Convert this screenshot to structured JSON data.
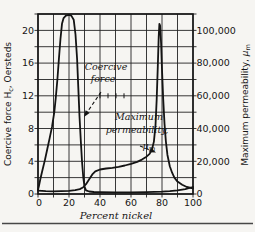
{
  "figure": {
    "paper_color": "#f6f5f2",
    "ink_color": "#141414"
  },
  "chart_data": {
    "type": "line",
    "xlabel": "Percent nickel",
    "ylabel_left": "Coercive force Hc, Oersteds",
    "ylabel_left_parts": {
      "pre": "Coercive force H",
      "sub": "c",
      "post": ", Oersteds"
    },
    "ylabel_right": "Maximum permeability, μm",
    "ylabel_right_parts": {
      "pre": "Maximum permeability, ",
      "mu": "μ",
      "sub": "m"
    },
    "xlim": [
      0,
      100
    ],
    "ylim_left": [
      0,
      22
    ],
    "ylim_right": [
      0,
      110000
    ],
    "grid": {
      "on": true,
      "x_step": 10,
      "y_left_step": 2,
      "y_right_step": 10000
    },
    "x_ticks": [
      "0",
      "20",
      "40",
      "60",
      "80",
      "100"
    ],
    "y_left_ticks": [
      "0",
      "4",
      "8",
      "12",
      "16",
      "20"
    ],
    "y_right_ticks": [
      "0",
      "20,000",
      "40,000",
      "60,000",
      "80,000",
      "100,000"
    ],
    "series": [
      {
        "name": "Coercive force",
        "axis": "left",
        "units": "Oersteds",
        "points": [
          [
            0,
            0.5
          ],
          [
            0.5,
            0.9
          ],
          [
            1.5,
            1.8
          ],
          [
            3,
            3
          ],
          [
            4.5,
            4.2
          ],
          [
            6,
            5.5
          ],
          [
            7.5,
            6.8
          ],
          [
            9,
            8.2
          ],
          [
            10.5,
            10
          ],
          [
            11.5,
            11.8
          ],
          [
            12.5,
            14
          ],
          [
            13.5,
            16.5
          ],
          [
            14.5,
            19
          ],
          [
            15.5,
            20.8
          ],
          [
            16.5,
            21.5
          ],
          [
            18,
            21.8
          ],
          [
            20,
            21.9
          ],
          [
            21.5,
            21.8
          ],
          [
            23,
            21.3
          ],
          [
            24.2,
            19.5
          ],
          [
            25.2,
            16.5
          ],
          [
            26,
            13
          ],
          [
            26.8,
            9.5
          ],
          [
            27.6,
            6.5
          ],
          [
            28.4,
            4
          ],
          [
            29.2,
            2
          ],
          [
            30,
            0.9
          ],
          [
            31,
            0.45
          ],
          [
            33,
            0.3
          ],
          [
            36,
            0.25
          ],
          [
            40,
            0.22
          ],
          [
            50,
            0.2
          ],
          [
            60,
            0.2
          ],
          [
            70,
            0.22
          ],
          [
            80,
            0.28
          ],
          [
            85,
            0.35
          ],
          [
            90,
            0.45
          ],
          [
            95,
            0.6
          ],
          [
            100,
            0.85
          ]
        ]
      },
      {
        "name": "Maximum permeability",
        "axis": "right",
        "units": "μm",
        "points": [
          [
            0,
            2000
          ],
          [
            5,
            1700
          ],
          [
            10,
            1600
          ],
          [
            15,
            1700
          ],
          [
            20,
            1900
          ],
          [
            24,
            2300
          ],
          [
            27,
            3000
          ],
          [
            29,
            4000
          ],
          [
            31,
            6000
          ],
          [
            33,
            9000
          ],
          [
            35,
            12000
          ],
          [
            37,
            13800
          ],
          [
            40,
            15000
          ],
          [
            44,
            15600
          ],
          [
            48,
            16000
          ],
          [
            52,
            16600
          ],
          [
            56,
            17400
          ],
          [
            60,
            18400
          ],
          [
            64,
            19600
          ],
          [
            67,
            21000
          ],
          [
            70,
            22800
          ],
          [
            72,
            24500
          ],
          [
            73.5,
            27000
          ],
          [
            74.8,
            32000
          ],
          [
            75.8,
            42000
          ],
          [
            76.6,
            58000
          ],
          [
            77.3,
            78000
          ],
          [
            77.9,
            96000
          ],
          [
            78.3,
            104000
          ],
          [
            78.8,
            103000
          ],
          [
            79.4,
            92000
          ],
          [
            80,
            76000
          ],
          [
            80.8,
            58000
          ],
          [
            81.6,
            43000
          ],
          [
            82.5,
            32000
          ],
          [
            83.5,
            24000
          ],
          [
            85,
            17000
          ],
          [
            86.5,
            13000
          ],
          [
            88,
            10000
          ],
          [
            90,
            7600
          ],
          [
            93,
            5600
          ],
          [
            96,
            4300
          ],
          [
            100,
            3400
          ]
        ]
      }
    ],
    "annotations": [
      {
        "label_lines": [
          "Coercive",
          "force"
        ],
        "points_to": "coercive-force-curve"
      },
      {
        "label_lines": [
          "Maximum",
          "permeability,"
        ],
        "symbol_mu": "μ",
        "symbol_sub": "m",
        "points_to": "max-permeability-curve"
      }
    ]
  }
}
